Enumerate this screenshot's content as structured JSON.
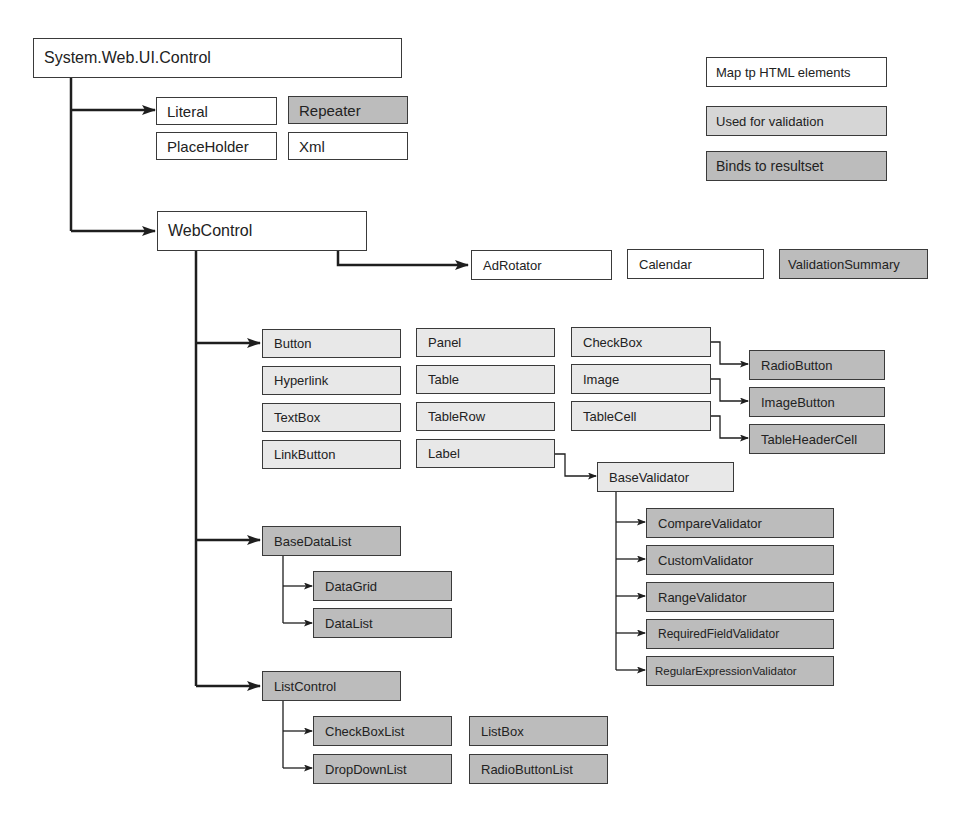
{
  "diagram": {
    "legend": [
      {
        "label": "Map tp HTML elements",
        "shade": "white"
      },
      {
        "label": "Used for validation",
        "shade": "mid"
      },
      {
        "label": "Binds to resultset",
        "shade": "dark"
      }
    ],
    "nodes": {
      "root": "System.Web.UI.Control",
      "literal": "Literal",
      "repeater": "Repeater",
      "placeholder": "PlaceHolder",
      "xml": "Xml",
      "webcontrol": "WebControl",
      "adrotator": "AdRotator",
      "calendar": "Calendar",
      "validationsummary": "ValidationSummary",
      "button": "Button",
      "hyperlink": "Hyperlink",
      "textbox": "TextBox",
      "linkbutton": "LinkButton",
      "panel": "Panel",
      "table": "Table",
      "tablerow": "TableRow",
      "label": "Label",
      "checkbox": "CheckBox",
      "image": "Image",
      "tablecell": "TableCell",
      "radiobutton": "RadioButton",
      "imagebutton": "ImageButton",
      "tableheadercell": "TableHeaderCell",
      "basevalidator": "BaseValidator",
      "comparevalidator": "CompareValidator",
      "customvalidator": "CustomValidator",
      "rangevalidator": "RangeValidator",
      "requiredfieldvalidator": "RequiredFieldValidator",
      "regularexpressionvalidator": "RegularExpressionValidator",
      "basedatalist": "BaseDataList",
      "datagrid": "DataGrid",
      "datalist": "DataList",
      "listcontrol": "ListControl",
      "checkboxlist": "CheckBoxList",
      "dropdownlist": "DropDownList",
      "listbox": "ListBox",
      "radiobuttonlist": "RadioButtonList"
    },
    "edges": [
      [
        "root",
        "literal"
      ],
      [
        "root",
        "webcontrol"
      ],
      [
        "webcontrol",
        "adrotator"
      ],
      [
        "webcontrol",
        "button"
      ],
      [
        "webcontrol",
        "basedatalist"
      ],
      [
        "webcontrol",
        "listcontrol"
      ],
      [
        "checkbox",
        "radiobutton"
      ],
      [
        "image",
        "imagebutton"
      ],
      [
        "tablecell",
        "tableheadercell"
      ],
      [
        "label",
        "basevalidator"
      ],
      [
        "basevalidator",
        "comparevalidator"
      ],
      [
        "basevalidator",
        "customvalidator"
      ],
      [
        "basevalidator",
        "rangevalidator"
      ],
      [
        "basevalidator",
        "requiredfieldvalidator"
      ],
      [
        "basevalidator",
        "regularexpressionvalidator"
      ],
      [
        "basedatalist",
        "datagrid"
      ],
      [
        "basedatalist",
        "datalist"
      ],
      [
        "listcontrol",
        "checkboxlist"
      ],
      [
        "listcontrol",
        "dropdownlist"
      ]
    ]
  }
}
